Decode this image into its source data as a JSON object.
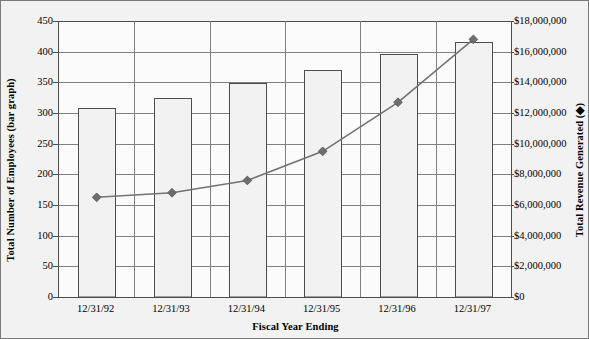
{
  "chart_data": {
    "type": "bar",
    "title": "",
    "subtitle": "",
    "xlabel": "Fiscal Year Ending",
    "ylabel": "Total Number of Employees (bar graph)",
    "y2label": "Total Revenue Generated (◆)",
    "categories": [
      "12/31/92",
      "12/31/93",
      "12/31/94",
      "12/31/95",
      "12/31/96",
      "12/31/97"
    ],
    "ylim": [
      0,
      450
    ],
    "y2lim": [
      0,
      18000000
    ],
    "yticks": [
      0,
      50,
      100,
      150,
      200,
      250,
      300,
      350,
      400,
      450
    ],
    "ytick_labels": [
      "0",
      "50",
      "100",
      "150",
      "200",
      "250",
      "300",
      "350",
      "400",
      "450"
    ],
    "y2ticks": [
      0,
      2000000,
      4000000,
      6000000,
      8000000,
      10000000,
      12000000,
      14000000,
      16000000,
      18000000
    ],
    "y2tick_labels": [
      "$0",
      "$2,000,000",
      "$4,000,000",
      "$6,000,000",
      "$8,000,000",
      "$10,000,000",
      "$12,000,000",
      "$14,000,000",
      "$16,000,000",
      "$18,000,000"
    ],
    "grid": true,
    "legend": false,
    "series": [
      {
        "name": "Total Number of Employees",
        "type": "bar",
        "axis": "left",
        "values": [
          308,
          325,
          349,
          370,
          396,
          416
        ]
      },
      {
        "name": "Total Revenue Generated",
        "type": "line",
        "axis": "right",
        "marker": "diamond",
        "values": [
          6500000,
          6800000,
          7600000,
          9500000,
          12700000,
          16800000
        ]
      }
    ],
    "colors": {
      "bar_fill": "#f2f2f2",
      "bar_stroke": "#4d4d4d",
      "line": "#737373",
      "marker": "#6e6e6e",
      "gridline": "#808080",
      "plot_background": "#fbfbfb",
      "figure_background": "#f2f2f2",
      "border": "#7a7a7a",
      "text": "#000000"
    }
  }
}
